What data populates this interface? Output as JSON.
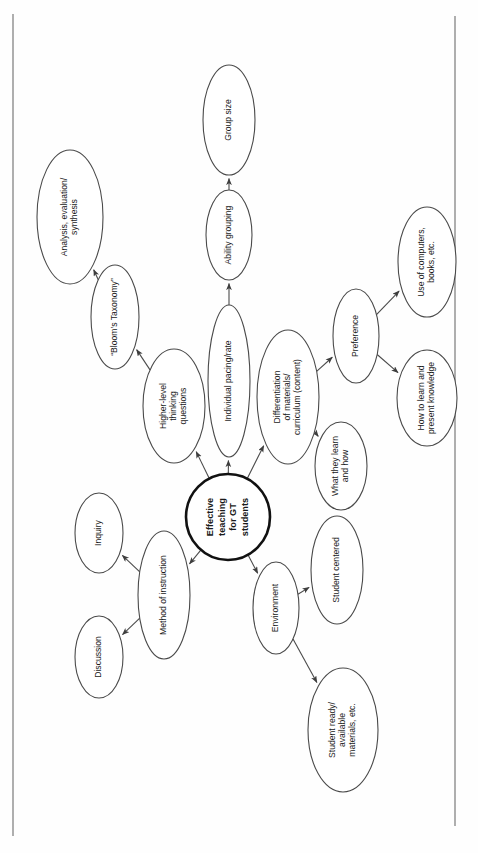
{
  "document": {
    "type": "concept-map",
    "orientation": "rotated-90-ccw",
    "title": "Effective teaching for GT students concept map"
  },
  "chart_data": {
    "type": "diagram",
    "nodes": [
      {
        "id": "center",
        "label": "Effective teaching for GT students",
        "lines": [
          "Effective",
          "teaching",
          "for GT",
          "students"
        ],
        "shape": "circle",
        "cx": 228,
        "cy": 517,
        "rx": 42,
        "ry": 43,
        "role": "root"
      },
      {
        "id": "bloom",
        "label": "“Bloom’s Taxonomy”",
        "lines": [
          "“Bloom’s Taxonomy”"
        ],
        "shape": "ellipse",
        "cx": 115,
        "cy": 317,
        "rx": 24,
        "ry": 52,
        "role": "leaf-branch"
      },
      {
        "id": "analysis",
        "label": "Analysis, evaluation/ synthesis",
        "lines": [
          "Analysis, evaluation/",
          "synthesis"
        ],
        "shape": "ellipse",
        "cx": 70,
        "cy": 217,
        "rx": 33,
        "ry": 67,
        "role": "leaf"
      },
      {
        "id": "higher",
        "label": "Higher-level thinking questions",
        "lines": [
          "Higher-level",
          "thinking",
          "questions"
        ],
        "shape": "ellipse",
        "cx": 174,
        "cy": 406,
        "rx": 31,
        "ry": 57,
        "role": "branch"
      },
      {
        "id": "pacing",
        "label": "Individual pacing/rate",
        "lines": [
          "Individual pacing/rate"
        ],
        "shape": "ellipse",
        "cx": 229,
        "cy": 381,
        "rx": 21,
        "ry": 76,
        "role": "branch"
      },
      {
        "id": "ability",
        "label": "Ability grouping",
        "lines": [
          "Ability grouping"
        ],
        "shape": "ellipse",
        "cx": 229,
        "cy": 235,
        "rx": 23,
        "ry": 45,
        "role": "branch"
      },
      {
        "id": "groupsize",
        "label": "Group size",
        "lines": [
          "Group size"
        ],
        "shape": "ellipse",
        "cx": 229,
        "cy": 120,
        "rx": 26,
        "ry": 55,
        "role": "leaf"
      },
      {
        "id": "diff",
        "label": "Differentiation of materials/ curriculum (content)",
        "lines": [
          "Differentiation",
          "of materials/",
          "curriculum (content)"
        ],
        "shape": "ellipse",
        "cx": 288,
        "cy": 397,
        "rx": 31,
        "ry": 67,
        "role": "branch"
      },
      {
        "id": "preference",
        "label": "Preference",
        "lines": [
          "Preference"
        ],
        "shape": "ellipse",
        "cx": 356,
        "cy": 336,
        "rx": 23,
        "ry": 47,
        "role": "branch"
      },
      {
        "id": "computers",
        "label": "Use of computers, books, etc.",
        "lines": [
          "Use of computers,",
          "books, etc."
        ],
        "shape": "ellipse",
        "cx": 427,
        "cy": 262,
        "rx": 29,
        "ry": 55,
        "role": "leaf"
      },
      {
        "id": "howlearn",
        "label": "How to learn and present knowledge",
        "lines": [
          "How to learn and",
          "present knowledge"
        ],
        "shape": "ellipse",
        "cx": 427,
        "cy": 398,
        "rx": 30,
        "ry": 48,
        "role": "leaf"
      },
      {
        "id": "whatlearn",
        "label": "What they learn and how",
        "lines": [
          "What they learn",
          "and how"
        ],
        "shape": "ellipse",
        "cx": 341,
        "cy": 466,
        "rx": 26,
        "ry": 44,
        "role": "leaf"
      },
      {
        "id": "method",
        "label": "Method of instruction",
        "lines": [
          "Method of instruction"
        ],
        "shape": "ellipse",
        "cx": 164,
        "cy": 595,
        "rx": 26,
        "ry": 64,
        "role": "branch"
      },
      {
        "id": "inquiry",
        "label": "Inquiry",
        "lines": [
          "Inquiry"
        ],
        "shape": "ellipse",
        "cx": 99,
        "cy": 533,
        "rx": 24,
        "ry": 40,
        "role": "leaf"
      },
      {
        "id": "discussion",
        "label": "Discussion",
        "lines": [
          "Discussion"
        ],
        "shape": "ellipse",
        "cx": 99,
        "cy": 657,
        "rx": 24,
        "ry": 41,
        "role": "leaf"
      },
      {
        "id": "environment",
        "label": "Environment",
        "lines": [
          "Environment"
        ],
        "shape": "ellipse",
        "cx": 276,
        "cy": 608,
        "rx": 23,
        "ry": 46,
        "role": "branch"
      },
      {
        "id": "studentcenter",
        "label": "Student centered",
        "lines": [
          "Student centered"
        ],
        "shape": "ellipse",
        "cx": 337,
        "cy": 570,
        "rx": 26,
        "ry": 54,
        "role": "leaf"
      },
      {
        "id": "studentready",
        "label": "Student ready/ available materials, etc.",
        "lines": [
          "Student ready/",
          "available",
          "materials, etc."
        ],
        "shape": "ellipse",
        "cx": 343,
        "cy": 730,
        "rx": 35,
        "ry": 62,
        "role": "leaf"
      }
    ],
    "edges": [
      {
        "from": "center",
        "to": "higher",
        "arrow": true
      },
      {
        "from": "center",
        "to": "pacing",
        "arrow": true
      },
      {
        "from": "center",
        "to": "diff",
        "arrow": true
      },
      {
        "from": "center",
        "to": "method",
        "arrow": true
      },
      {
        "from": "center",
        "to": "environment",
        "arrow": true
      },
      {
        "from": "higher",
        "to": "bloom",
        "arrow": true
      },
      {
        "from": "bloom",
        "to": "analysis",
        "arrow": true
      },
      {
        "from": "pacing",
        "to": "ability",
        "arrow": true
      },
      {
        "from": "ability",
        "to": "groupsize",
        "arrow": true
      },
      {
        "from": "diff",
        "to": "preference",
        "arrow": true
      },
      {
        "from": "diff",
        "to": "whatlearn",
        "arrow": true
      },
      {
        "from": "preference",
        "to": "computers",
        "arrow": true
      },
      {
        "from": "preference",
        "to": "howlearn",
        "arrow": true
      },
      {
        "from": "method",
        "to": "inquiry",
        "arrow": true
      },
      {
        "from": "method",
        "to": "discussion",
        "arrow": true
      },
      {
        "from": "environment",
        "to": "studentcenter",
        "arrow": true
      },
      {
        "from": "environment",
        "to": "studentready",
        "arrow": true
      }
    ],
    "colors": {
      "node_stroke": "#4a4a4a",
      "center_stroke": "#111111",
      "edge_stroke": "#4a4a4a",
      "text": "#1a1a1a",
      "background": "#fefefe"
    }
  }
}
